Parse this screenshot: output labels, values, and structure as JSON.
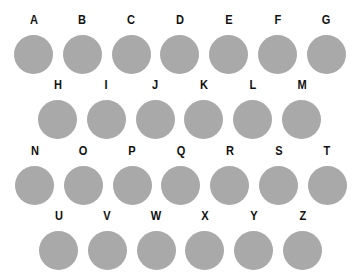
{
  "colors": {
    "background": "#ffffff",
    "circle": "#a9a9a9",
    "label": "#111111"
  },
  "rows": [
    {
      "letters": [
        "A",
        "B",
        "C",
        "D",
        "E",
        "F",
        "G"
      ]
    },
    {
      "letters": [
        "H",
        "I",
        "J",
        "K",
        "L",
        "M"
      ]
    },
    {
      "letters": [
        "N",
        "O",
        "P",
        "Q",
        "R",
        "S",
        "T"
      ]
    },
    {
      "letters": [
        "U",
        "V",
        "W",
        "X",
        "Y",
        "Z"
      ]
    }
  ]
}
